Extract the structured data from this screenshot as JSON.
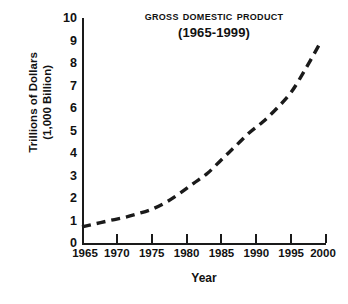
{
  "chart_data": {
    "type": "line",
    "title": "Gross Domestic Product",
    "subtitle": "(1965-1999)",
    "xlabel": "Year",
    "ylabel_line1": "Trillions of Dollars",
    "ylabel_line2": "(1,000 Billion)",
    "xlim": [
      1965,
      2000
    ],
    "ylim": [
      0,
      10
    ],
    "grid": false,
    "legend": "none",
    "line_style": "dashed",
    "line_color": "#1a1a1a",
    "xticks": [
      1965,
      1970,
      1975,
      1980,
      1985,
      1990,
      1995,
      2000
    ],
    "xtick_labels": [
      "1965",
      "1970",
      "1975",
      "1980",
      "1985",
      "1990",
      "1995",
      "2000"
    ],
    "yticks": [
      0,
      1,
      2,
      3,
      4,
      5,
      6,
      7,
      8,
      9,
      10
    ],
    "ytick_labels": [
      "0",
      "1",
      "2",
      "3",
      "4",
      "5",
      "6",
      "7",
      "8",
      "9",
      "10"
    ],
    "x": [
      1965,
      1967,
      1969,
      1971,
      1973,
      1975,
      1977,
      1979,
      1981,
      1983,
      1985,
      1987,
      1989,
      1991,
      1993,
      1995,
      1997,
      1999
    ],
    "values": [
      0.72,
      0.86,
      1.0,
      1.13,
      1.3,
      1.5,
      1.8,
      2.2,
      2.65,
      3.1,
      3.7,
      4.3,
      4.9,
      5.4,
      6.0,
      6.7,
      7.7,
      8.8
    ],
    "series": [
      {
        "name": "Gross Domestic Product",
        "values": [
          0.72,
          0.86,
          1.0,
          1.13,
          1.3,
          1.5,
          1.8,
          2.2,
          2.65,
          3.1,
          3.7,
          4.3,
          4.9,
          5.4,
          6.0,
          6.7,
          7.7,
          8.8
        ]
      }
    ]
  }
}
